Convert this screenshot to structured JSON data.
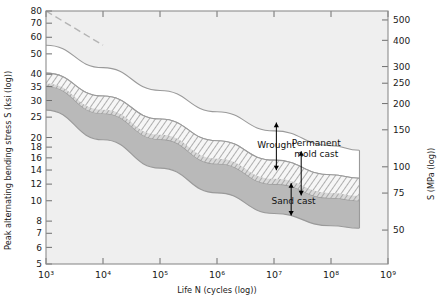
{
  "chart_data": {
    "type": "area",
    "title": "",
    "xlabel": "Life N (cycles (log))",
    "ylabel": "Peak alternating bending stress S (ksi (log))",
    "ylabel_right": "S (MPa (log))",
    "xscale": "log",
    "yscale": "log",
    "xlim": [
      1000,
      1000000000
    ],
    "ylim": [
      5,
      80
    ],
    "grid": false,
    "legend": "none",
    "xticks": [
      {
        "value": 1000,
        "label": "10³"
      },
      {
        "value": 10000,
        "label": "10⁴"
      },
      {
        "value": 100000,
        "label": "10⁵"
      },
      {
        "value": 1000000,
        "label": "10⁶"
      },
      {
        "value": 10000000,
        "label": "10⁷"
      },
      {
        "value": 100000000,
        "label": "10⁸"
      },
      {
        "value": 1000000000,
        "label": "10⁹"
      }
    ],
    "yticks_left": [
      {
        "value": 80,
        "label": "80"
      },
      {
        "value": 70,
        "label": "70"
      },
      {
        "value": 60,
        "label": "60"
      },
      {
        "value": 50,
        "label": "50"
      },
      {
        "value": 40,
        "label": "40"
      },
      {
        "value": 35,
        "label": "35"
      },
      {
        "value": 30,
        "label": "30"
      },
      {
        "value": 25,
        "label": "25"
      },
      {
        "value": 20,
        "label": "20"
      },
      {
        "value": 18,
        "label": "18"
      },
      {
        "value": 16,
        "label": "16"
      },
      {
        "value": 14,
        "label": "14"
      },
      {
        "value": 12,
        "label": "12"
      },
      {
        "value": 10,
        "label": "10"
      },
      {
        "value": 8,
        "label": "8"
      },
      {
        "value": 7,
        "label": "7"
      },
      {
        "value": 6,
        "label": "6"
      },
      {
        "value": 5,
        "label": "5"
      }
    ],
    "yticks_right": [
      {
        "value_mpa": 500,
        "label": "500"
      },
      {
        "value_mpa": 400,
        "label": "400"
      },
      {
        "value_mpa": 300,
        "label": "300"
      },
      {
        "value_mpa": 250,
        "label": "250"
      },
      {
        "value_mpa": 200,
        "label": "200"
      },
      {
        "value_mpa": 150,
        "label": "150"
      },
      {
        "value_mpa": 100,
        "label": "100"
      },
      {
        "value_mpa": 75,
        "label": "75"
      },
      {
        "value_mpa": 50,
        "label": "50"
      }
    ],
    "bands": [
      {
        "name": "Wrought",
        "label": "Wrought",
        "fill": "#ffffff",
        "pattern": "solid",
        "upper_ksi": [
          55.0,
          43.0,
          33.5,
          26.5,
          21.5,
          18.3,
          17.4
        ],
        "lower_ksi": [
          40.5,
          31.5,
          24.5,
          19.3,
          15.6,
          13.3,
          12.8
        ],
        "x_points": [
          1000,
          10000,
          100000,
          1000000,
          10000000,
          100000000,
          316000000
        ]
      },
      {
        "name": "Permanent mold cast",
        "label": "Permanent mold cast",
        "fill": "#f4f4f4",
        "pattern": "hatched",
        "upper_ksi": [
          40.5,
          31.5,
          24.5,
          19.3,
          15.6,
          13.3,
          12.8
        ],
        "lower_ksi": [
          35.0,
          26.0,
          19.6,
          15.0,
          12.0,
          10.3,
          10.0
        ],
        "x_points": [
          1000,
          10000,
          100000,
          1000000,
          10000000,
          100000000,
          316000000
        ]
      },
      {
        "name": "Sand cast",
        "label": "Sand cast",
        "fill": "#b8b8b8",
        "pattern": "solid",
        "upper_ksi": [
          35.0,
          26.0,
          19.6,
          15.0,
          12.0,
          10.3,
          10.0
        ],
        "lower_ksi": [
          27.0,
          19.5,
          14.3,
          10.9,
          8.7,
          7.6,
          7.4
        ],
        "x_points": [
          1000,
          10000,
          100000,
          1000000,
          10000000,
          100000000,
          316000000
        ]
      }
    ],
    "dashed_extension": {
      "name": "upper-dashed-extension",
      "from_ksi": 80,
      "to_ksi": 55,
      "x_from": 1000,
      "x_to": 10000
    },
    "annotations": [
      {
        "name": "wrought-label",
        "text": "Wrought",
        "x": 10000000,
        "y_ksi": 21.0
      },
      {
        "name": "permanent-mold-cast-label",
        "text": "Permanent mold cast",
        "x": 40000000,
        "y_ksi": 16.5
      },
      {
        "name": "sand-cast-label",
        "text": "Sand cast",
        "x": 20000000,
        "y_ksi": 9.6
      }
    ],
    "colors": {
      "wrought_fill": "#ffffff",
      "permanent_mold_fill": "#f2f2f2",
      "sand_cast_fill": "#b9b9b9",
      "plot_background": "#efefef",
      "frame": "#8d8d8d",
      "dashed_line": "#b0b0b0"
    }
  }
}
